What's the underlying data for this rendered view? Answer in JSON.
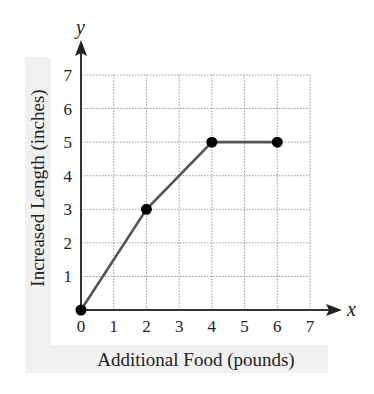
{
  "chart_data": {
    "type": "line",
    "title": "",
    "xlabel": "Additional Food (pounds)",
    "ylabel": "Increased Length (inches)",
    "x_axis_var": "x",
    "y_axis_var": "y",
    "xlim": [
      0,
      7
    ],
    "ylim": [
      0,
      7
    ],
    "x_ticks": [
      "0",
      "1",
      "2",
      "3",
      "4",
      "5",
      "6",
      "7"
    ],
    "y_ticks": [
      "1",
      "2",
      "3",
      "4",
      "5",
      "6",
      "7"
    ],
    "grid": true,
    "legend": null,
    "series": [
      {
        "name": "Increased Length",
        "x": [
          0,
          2,
          4,
          6
        ],
        "values": [
          0,
          3,
          5,
          5
        ],
        "markers": true
      }
    ]
  },
  "colors": {
    "line": "#555555",
    "marker": "#000000",
    "axis": "#333333",
    "grid": "#9a9a9a",
    "label_panel": "#f1f1f1"
  }
}
